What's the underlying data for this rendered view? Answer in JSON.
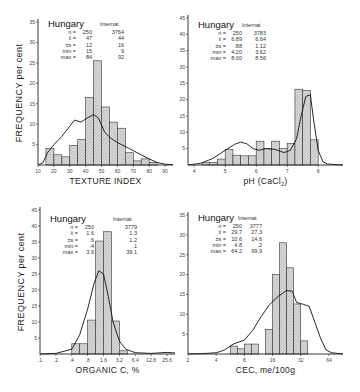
{
  "ylabel": "FREQUENCY per cent",
  "chart_data": [
    {
      "type": "bar",
      "id": "texture",
      "title": "Hungary",
      "xlabel": "TEXTURE INDEX",
      "ylabel": "FREQUENCY per cent",
      "x_ticks": [
        "10",
        "20",
        "30",
        "40",
        "50",
        "60",
        "70",
        "80",
        "90"
      ],
      "y_ticks": [
        "5",
        "10",
        "15",
        "20",
        "25",
        "30",
        "35"
      ],
      "ylim": [
        0,
        35
      ],
      "bin_edges": [
        15,
        20,
        25,
        30,
        35,
        40,
        45,
        50,
        55,
        60,
        65,
        70,
        75,
        80,
        85
      ],
      "values": [
        4.0,
        2.5,
        2.0,
        4.8,
        6.3,
        16.5,
        25.5,
        14.2,
        10.5,
        9.0,
        3.0,
        1.0,
        1.5,
        0.6
      ],
      "curve_label": "Internat",
      "curve": [
        [
          10,
          0
        ],
        [
          13,
          0.5
        ],
        [
          16,
          3
        ],
        [
          20,
          5
        ],
        [
          25,
          7
        ],
        [
          30,
          9.5
        ],
        [
          33,
          11
        ],
        [
          37,
          10.5
        ],
        [
          41,
          11.5
        ],
        [
          45,
          12.3
        ],
        [
          48,
          11.5
        ],
        [
          52,
          8
        ],
        [
          56,
          6.5
        ],
        [
          60,
          5.5
        ],
        [
          65,
          4.5
        ],
        [
          70,
          3.5
        ],
        [
          75,
          2.5
        ],
        [
          80,
          1.5
        ],
        [
          85,
          0.6
        ],
        [
          90,
          0.2
        ],
        [
          95,
          0.1
        ]
      ],
      "stats": {
        "labels": [
          "n =",
          "x̄ =",
          "±s =",
          "min =",
          "max ="
        ],
        "hungary": [
          "250",
          "47",
          "12",
          "15",
          "84"
        ],
        "internat": [
          "3764",
          "44",
          "16",
          "9",
          "92"
        ]
      },
      "legend_left": "Hungary",
      "legend_right": "Internat"
    },
    {
      "type": "bar",
      "id": "ph",
      "title": "Hungary",
      "xlabel": "pH (CaCl2)",
      "ylabel": "",
      "x_ticks": [
        "4",
        "5",
        "6",
        "7",
        "8"
      ],
      "y_ticks": [
        "5",
        "10",
        "15",
        "20",
        "25",
        "30",
        "35",
        "40",
        "45"
      ],
      "ylim": [
        0,
        45
      ],
      "bin_edges": [
        4.25,
        4.5,
        4.75,
        5.0,
        5.25,
        5.5,
        5.75,
        6.0,
        6.25,
        6.5,
        6.75,
        7.0,
        7.25,
        7.5,
        7.75,
        8.0
      ],
      "values": [
        0.7,
        0.8,
        1.8,
        4.7,
        3.0,
        2.8,
        2.8,
        7.3,
        5.0,
        7.3,
        5.0,
        6.6,
        23.2,
        22.8,
        7.7
      ],
      "curve_label": "Internat",
      "curve": [
        [
          3.8,
          0
        ],
        [
          4.2,
          0.5
        ],
        [
          4.6,
          2
        ],
        [
          5.0,
          4.5
        ],
        [
          5.3,
          6.3
        ],
        [
          5.5,
          7.0
        ],
        [
          5.7,
          6.5
        ],
        [
          5.9,
          5.0
        ],
        [
          6.1,
          4.5
        ],
        [
          6.3,
          5.0
        ],
        [
          6.6,
          4.8
        ],
        [
          6.9,
          3.8
        ],
        [
          7.1,
          4.5
        ],
        [
          7.3,
          8
        ],
        [
          7.45,
          15
        ],
        [
          7.6,
          21
        ],
        [
          7.75,
          21.5
        ],
        [
          7.85,
          14
        ],
        [
          8.0,
          4.5
        ],
        [
          8.15,
          1
        ],
        [
          8.3,
          0.3
        ],
        [
          8.8,
          0
        ]
      ],
      "stats": {
        "labels": [
          "n =",
          "x̄ =",
          "±s =",
          "min =",
          "max ="
        ],
        "hungary": [
          "250",
          "6.89",
          ".88",
          "4.20",
          "8.00"
        ],
        "internat": [
          "3783",
          "6.64",
          "1.12",
          "3.62",
          "8.56"
        ]
      },
      "legend_left": "Hungary",
      "legend_right": "Internat"
    },
    {
      "type": "bar",
      "id": "organic_c",
      "title": "Hungary",
      "xlabel": "ORGANIC C, %",
      "ylabel": "FREQUENCY per cent",
      "x_ticks": [
        ".1",
        ".2",
        ".4",
        ".8",
        "1.6",
        "3.2",
        "6.4",
        "12.8",
        "25.6"
      ],
      "y_ticks": [
        "5",
        "10",
        "15",
        "20",
        "25",
        "30",
        "35",
        "40",
        "45"
      ],
      "ylim": [
        0,
        45
      ],
      "bin_edges_log2_index": [
        2,
        2.5,
        3,
        3.5,
        4,
        4.5,
        5,
        5.5
      ],
      "values": [
        3.2,
        3.2,
        10.6,
        35.3,
        38.2,
        10.3,
        1.0
      ],
      "curve_label": "Internat",
      "curve": [
        [
          0,
          0
        ],
        [
          1,
          0.2
        ],
        [
          2,
          1.5
        ],
        [
          2.5,
          6
        ],
        [
          3,
          14
        ],
        [
          3.4,
          22
        ],
        [
          3.7,
          26
        ],
        [
          4.0,
          25
        ],
        [
          4.3,
          18
        ],
        [
          4.6,
          10
        ],
        [
          5.0,
          4
        ],
        [
          5.4,
          1.5
        ],
        [
          6,
          0.4
        ],
        [
          7,
          0.2
        ],
        [
          8,
          0.5
        ],
        [
          8.5,
          0.3
        ]
      ],
      "stats": {
        "labels": [
          "n =",
          "x̄ =",
          "±s =",
          "min =",
          "max ="
        ],
        "hungary": [
          "250",
          "1.6",
          ".6",
          ".4",
          "3.9"
        ],
        "internat": [
          "3779",
          "1.3",
          "1.2",
          ".1",
          "39.1"
        ]
      },
      "legend_left": "Hungary",
      "legend_right": "Internat"
    },
    {
      "type": "bar",
      "id": "cec",
      "title": "Hungary",
      "xlabel": "CEC, me/100g",
      "ylabel": "",
      "x_ticks": [
        "2",
        "4",
        "8",
        "16",
        "32",
        "64"
      ],
      "y_ticks": [
        "5",
        "10",
        "15",
        "20",
        "25",
        "30",
        "35"
      ],
      "ylim": [
        0,
        35
      ],
      "bin_edges_log2": [
        2.5,
        2.75,
        3.0,
        3.25,
        3.5,
        3.75,
        4.0,
        4.25,
        4.5,
        4.75,
        5.0,
        5.25,
        5.5,
        5.75,
        6.0
      ],
      "values": [
        2.0,
        1.3,
        2.5,
        2.5,
        0,
        6.2,
        20.0,
        28.0,
        21.7,
        12.6,
        3.3
      ],
      "curve_label": "Internat",
      "curve": [
        [
          1,
          0
        ],
        [
          1.5,
          0.1
        ],
        [
          2,
          0.3
        ],
        [
          2.3,
          1
        ],
        [
          2.6,
          2.5
        ],
        [
          3.0,
          3.5
        ],
        [
          3.3,
          6
        ],
        [
          3.6,
          9.5
        ],
        [
          3.9,
          12.5
        ],
        [
          4.2,
          14.5
        ],
        [
          4.5,
          16.0
        ],
        [
          4.7,
          15.8
        ],
        [
          4.85,
          13.0
        ],
        [
          5.1,
          12.5
        ],
        [
          5.3,
          12.0
        ],
        [
          5.5,
          8
        ],
        [
          5.7,
          4
        ],
        [
          5.9,
          1
        ],
        [
          6.1,
          0.3
        ],
        [
          6.5,
          0
        ]
      ],
      "stats": {
        "labels": [
          "n =",
          "x̄ =",
          "±s =",
          "min =",
          "max ="
        ],
        "hungary": [
          "250",
          "29.7",
          "10.6",
          "4.8",
          "64.2"
        ],
        "internat": [
          "3777",
          "27.3",
          "14.6",
          ".2",
          "99.9"
        ]
      },
      "legend_left": "Hungary",
      "legend_right": "Internat"
    }
  ]
}
